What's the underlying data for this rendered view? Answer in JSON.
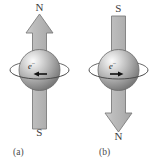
{
  "figure": {
    "type": "physics-diagram",
    "background_color": "#ffffff"
  },
  "colors": {
    "arrow_fill": "#b9b9b9",
    "arrow_stroke": "#7d7d7d",
    "sphere_light": "#f2f2f2",
    "sphere_mid": "#b0b0b0",
    "sphere_dark": "#6e6e6e",
    "sphere_stroke": "#6a6a6a",
    "orbit_stroke": "#585858",
    "spin_arrow": "#111111",
    "text": "#3c3c3c"
  },
  "panels": [
    {
      "id": "a",
      "caption": "(a)",
      "top_pole_label": "N",
      "bottom_pole_label": "S",
      "arrow_direction": "up",
      "spin_arrow_direction": "left",
      "particle_label": "e",
      "particle_charge": "−"
    },
    {
      "id": "b",
      "caption": "(b)",
      "top_pole_label": "S",
      "bottom_pole_label": "N",
      "arrow_direction": "down",
      "spin_arrow_direction": "right",
      "particle_label": "e",
      "particle_charge": "−"
    }
  ]
}
